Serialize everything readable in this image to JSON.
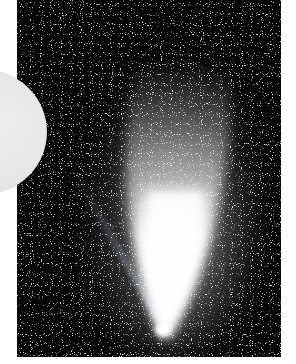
{
  "image": {
    "subject": "Comet with bright nucleus and broad dust tail against a dense star field",
    "alt": "Long-exposure photograph of a bright comet with a white fan-shaped tail extending upward and faint bluish ion-tail streaks to the left, over a star-filled black sky",
    "colors": {
      "sky": "#050505",
      "tail_core": "#ffffff",
      "tail_glow": "#9a9a9a",
      "overlay_disc": "#e6e6e6",
      "background": "#ffffff"
    },
    "photo_bounds": {
      "x": 17,
      "y": 0,
      "width": 264,
      "height": 357
    },
    "comet_nucleus": {
      "x": 163,
      "y": 328
    },
    "overlay_disc": {
      "center_x": -15,
      "center_y": 132,
      "radius": 62
    }
  }
}
